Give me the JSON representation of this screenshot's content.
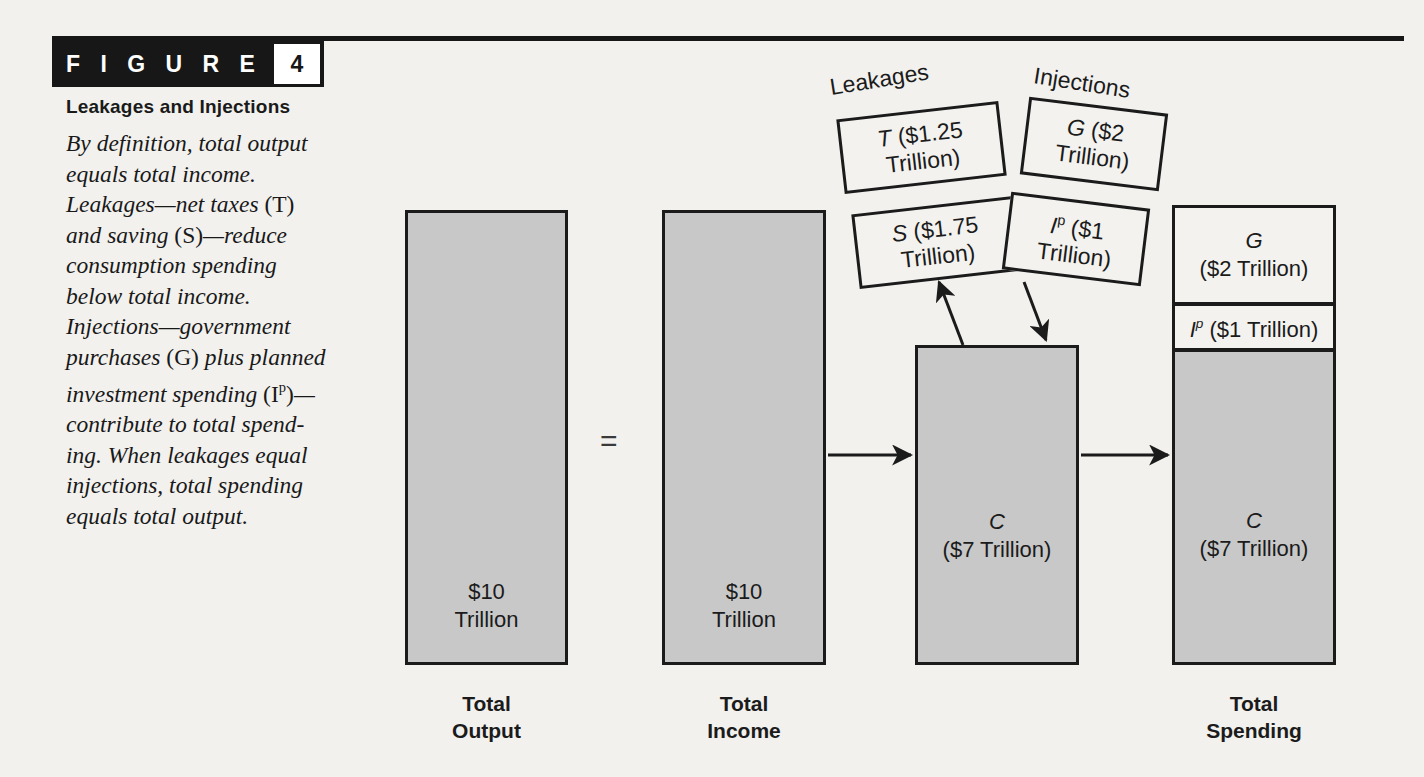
{
  "figure": {
    "word": "F I G U R E",
    "number": "4",
    "title": "Leakages and Injections",
    "caption_lines": [
      "By definition, total output",
      "equals total income.",
      "Leakages—net taxes (T)",
      "and saving (S)—reduce",
      "consumption spending",
      "below total income.",
      "Injections—government",
      "purchases (G) plus planned",
      "investment spending (Ip)—",
      "contribute to total spend-",
      "ing. When leakages equal",
      "injections, total spending",
      "equals total output."
    ]
  },
  "bars": {
    "output": {
      "value_line1": "$10",
      "value_line2": "Trillion",
      "axis_label_line1": "Total",
      "axis_label_line2": "Output"
    },
    "income": {
      "value_line1": "$10",
      "value_line2": "Trillion",
      "axis_label_line1": "Total",
      "axis_label_line2": "Income"
    },
    "consumption": {
      "symbol": "C",
      "amount": "($7 Trillion)"
    },
    "spending": {
      "axis_label_line1": "Total",
      "axis_label_line2": "Spending",
      "segments": [
        {
          "symbol": "G",
          "amount": "($2 Trillion)"
        },
        {
          "symbol": "I",
          "superscript": "p",
          "amount": "($1 Trillion)"
        },
        {
          "symbol": "C",
          "amount": "($7 Trillion)"
        }
      ]
    }
  },
  "equals_sign": "=",
  "leakages": {
    "group_label": "Leakages",
    "items": [
      {
        "symbol": "T",
        "amount_line1": "($1.25",
        "amount_line2": "Trillion)"
      },
      {
        "symbol": "S",
        "amount_line1": "($1.75",
        "amount_line2": "Trillion)"
      }
    ]
  },
  "injections": {
    "group_label": "Injections",
    "items": [
      {
        "symbol": "G",
        "superscript": "",
        "amount_line1": "($2",
        "amount_line2": "Trillion)"
      },
      {
        "symbol": "I",
        "superscript": "p",
        "amount_line1": "($1",
        "amount_line2": "Trillion)"
      }
    ]
  },
  "chart_data": {
    "type": "bar",
    "title": "Leakages and Injections",
    "unit": "trillions of dollars",
    "categories": [
      "Total Output",
      "Total Income",
      "Consumption",
      "Total Spending"
    ],
    "values": [
      10,
      10,
      7,
      10
    ],
    "series": [
      {
        "name": "C",
        "values": [
          null,
          null,
          7,
          7
        ]
      },
      {
        "name": "Ip",
        "values": [
          null,
          null,
          null,
          1
        ]
      },
      {
        "name": "G",
        "values": [
          null,
          null,
          null,
          2
        ]
      },
      {
        "name": "Total",
        "values": [
          10,
          10,
          7,
          10
        ]
      }
    ],
    "leakages": [
      {
        "name": "T",
        "value": 1.25
      },
      {
        "name": "S",
        "value": 1.75
      }
    ],
    "injections": [
      {
        "name": "G",
        "value": 2
      },
      {
        "name": "Ip",
        "value": 1
      }
    ],
    "ylim": [
      0,
      10
    ],
    "grid": false,
    "legend": "none"
  },
  "colors": {
    "page_background": "#f2f1ee",
    "bar_fill": "#c8c8c8",
    "bar_light_fill": "#f3f2ef",
    "outline": "#1b1b1b",
    "tab_background": "#171717"
  }
}
